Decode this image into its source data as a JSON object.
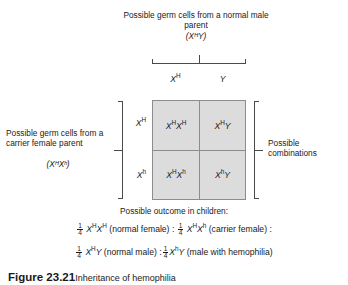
{
  "figure": {
    "top_parent": {
      "label": "Possible germ cells from a normal male parent",
      "genotype": "(XᴴY)"
    },
    "left_parent": {
      "label": "Possible germ cells from a carrier female parent",
      "genotype": "(XᴴXʰ)"
    },
    "right_label": "Possible combinations",
    "columns": [
      {
        "base": "X",
        "sup": "H",
        "display": "Xᴴ"
      },
      {
        "base": "Y",
        "sup": "",
        "display": "Y"
      }
    ],
    "rows": [
      {
        "base": "X",
        "sup": "H",
        "display": "Xᴴ"
      },
      {
        "base": "X",
        "sup": "h",
        "display": "Xʰ"
      }
    ],
    "cells": [
      [
        {
          "display": "XᴴXᴴ",
          "parts": [
            {
              "base": "X",
              "sup": "H"
            },
            {
              "base": "X",
              "sup": "H"
            }
          ]
        },
        {
          "display": "XᴴY",
          "parts": [
            {
              "base": "X",
              "sup": "H"
            },
            {
              "base": "Y",
              "sup": ""
            }
          ]
        }
      ],
      [
        {
          "display": "XᴴXʰ",
          "parts": [
            {
              "base": "X",
              "sup": "H"
            },
            {
              "base": "X",
              "sup": "h"
            }
          ]
        },
        {
          "display": "XʰY",
          "parts": [
            {
              "base": "X",
              "sup": "h"
            },
            {
              "base": "Y",
              "sup": ""
            }
          ]
        }
      ]
    ],
    "outcome": {
      "heading": "Possible outcome in children:",
      "items": [
        {
          "numerator": "1",
          "denominator": "4",
          "genotype_base": "X",
          "genotype_sup": "H",
          "genotype_base2": "X",
          "genotype_sup2": "H",
          "description": "(normal female)",
          "separator": ":"
        },
        {
          "numerator": "1",
          "denominator": "4",
          "genotype_base": "X",
          "genotype_sup": "H",
          "genotype_base2": "X",
          "genotype_sup2": "h",
          "description": "(carrier female)",
          "separator": ":"
        },
        {
          "numerator": "1",
          "denominator": "4",
          "genotype_base": "X",
          "genotype_sup": "H",
          "genotype_base2": "Y",
          "genotype_sup2": "",
          "description": "(normal male)",
          "separator": ":"
        },
        {
          "numerator": "1",
          "denominator": "4",
          "genotype_base": "X",
          "genotype_sup": "h",
          "genotype_base2": "Y",
          "genotype_sup2": "",
          "description": "(male with hemophilia)",
          "separator": ""
        }
      ]
    },
    "caption": {
      "number": "Figure 23.21",
      "text": "Inheritance of hemophilia"
    },
    "colors": {
      "cell_fill": "#dcdcdc",
      "grid_line": "#8c8c8c",
      "bracket": "#4a4a4a",
      "text": "#1a1a1a",
      "background": "#ffffff"
    }
  }
}
